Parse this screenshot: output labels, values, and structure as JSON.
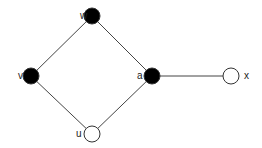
{
  "graph": {
    "nodes": [
      {
        "id": "w",
        "label": "w",
        "x": 92,
        "y": 16,
        "filled": true,
        "label_dx": -12,
        "label_dy": 3
      },
      {
        "id": "v",
        "label": "v",
        "x": 31,
        "y": 76,
        "filled": true,
        "label_dx": -13,
        "label_dy": 3
      },
      {
        "id": "a",
        "label": "a",
        "x": 152,
        "y": 76,
        "filled": true,
        "label_dx": -15,
        "label_dy": 3
      },
      {
        "id": "x",
        "label": "x",
        "x": 231,
        "y": 76,
        "filled": false,
        "label_dx": 13,
        "label_dy": 3
      },
      {
        "id": "u",
        "label": "u",
        "x": 92,
        "y": 134,
        "filled": false,
        "label_dx": -16,
        "label_dy": 3
      }
    ],
    "edges": [
      [
        "w",
        "v"
      ],
      [
        "w",
        "a"
      ],
      [
        "v",
        "u"
      ],
      [
        "a",
        "u"
      ],
      [
        "a",
        "x"
      ]
    ],
    "node_radius": 8,
    "colors": {
      "filled": "#000000",
      "empty": "#ffffff",
      "stroke": "#333333",
      "edge": "#444444"
    }
  }
}
